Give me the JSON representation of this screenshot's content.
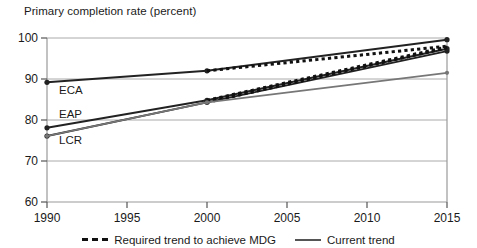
{
  "chart_data": {
    "type": "line",
    "title": "Primary completion rate (percent)",
    "xlabel": "",
    "ylabel": "",
    "xlim": [
      1990,
      2015
    ],
    "ylim": [
      60,
      100
    ],
    "xticks": [
      "1990",
      "1995",
      "2000",
      "2005",
      "2010",
      "2015"
    ],
    "yticks": [
      "60",
      "70",
      "80",
      "90",
      "100"
    ],
    "grid": true,
    "legend_position": "bottom",
    "annotations": [
      "ECA",
      "EAP",
      "LCR"
    ],
    "series": [
      {
        "name": "ECA current trend",
        "region": "ECA",
        "style": "solid",
        "color": "#222222",
        "x": [
          1990,
          2000,
          2015
        ],
        "values": [
          89.2,
          92.0,
          99.6
        ]
      },
      {
        "name": "ECA required trend to achieve MDG",
        "region": "ECA",
        "style": "dashed",
        "color": "#111111",
        "x": [
          2000,
          2015
        ],
        "values": [
          92.0,
          98.0
        ]
      },
      {
        "name": "EAP current trend",
        "region": "EAP",
        "style": "solid",
        "color": "#222222",
        "x": [
          1990,
          2000,
          2015
        ],
        "values": [
          78.1,
          84.8,
          97.4
        ]
      },
      {
        "name": "EAP required trend to achieve MDG",
        "region": "EAP",
        "style": "dashed",
        "color": "#111111",
        "x": [
          2000,
          2015
        ],
        "values": [
          84.8,
          97.8
        ]
      },
      {
        "name": "LCR current trend",
        "region": "LCR",
        "style": "solid",
        "color": "#222222",
        "x": [
          1990,
          2000,
          2015
        ],
        "values": [
          76.1,
          84.3,
          96.8
        ]
      },
      {
        "name": "LCR required trend to achieve MDG",
        "region": "LCR",
        "style": "dashed",
        "color": "#111111",
        "x": [
          2000,
          2015
        ],
        "values": [
          84.3,
          97.6
        ]
      },
      {
        "name": "Lower current trend",
        "region": "",
        "style": "solid",
        "color": "#777777",
        "x": [
          1990,
          2000,
          2015
        ],
        "values": [
          76.1,
          84.3,
          91.5
        ]
      }
    ]
  },
  "legend": {
    "items": [
      {
        "label": "Required trend to achieve MDG",
        "style": "dashed"
      },
      {
        "label": "Current trend",
        "style": "solid"
      }
    ]
  },
  "annotations": {
    "eca": "ECA",
    "eap": "EAP",
    "lcr": "LCR"
  },
  "colors": {
    "axis": "#999999",
    "grid": "#aaaaaa",
    "dark_line": "#222222",
    "gray_line": "#777777",
    "dash_line": "#111111",
    "text": "#1a1a1a"
  }
}
